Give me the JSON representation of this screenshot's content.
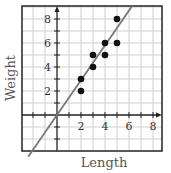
{
  "chart_data": {
    "type": "scatter",
    "title": "",
    "xlabel": "Length",
    "ylabel": "Weight",
    "xlim": [
      -3,
      8.75
    ],
    "ylim": [
      -3,
      9.1
    ],
    "grid": true,
    "x_ticks": [
      2,
      4,
      6,
      8
    ],
    "y_ticks": [
      2,
      4,
      6,
      8
    ],
    "x_tick_labels": [
      "2",
      "4",
      "6",
      "8"
    ],
    "y_tick_labels": [
      "2",
      "4",
      "6",
      "8"
    ],
    "points": [
      {
        "x": 2,
        "y": 2
      },
      {
        "x": 2,
        "y": 3
      },
      {
        "x": 3,
        "y": 4
      },
      {
        "x": 3,
        "y": 5
      },
      {
        "x": 4,
        "y": 5
      },
      {
        "x": 4,
        "y": 6
      },
      {
        "x": 5,
        "y": 6
      },
      {
        "x": 5,
        "y": 8
      }
    ],
    "trend_line": {
      "slope": 1.45,
      "intercept": 0,
      "color": "#777777"
    },
    "point_color": "#111111",
    "legend": null
  },
  "labels": {
    "xlabel": "Length",
    "ylabel": "Weight",
    "x1": "2",
    "x2": "4",
    "x3": "6",
    "x4": "8",
    "y1": "2",
    "y2": "4",
    "y3": "6",
    "y4": "8"
  }
}
